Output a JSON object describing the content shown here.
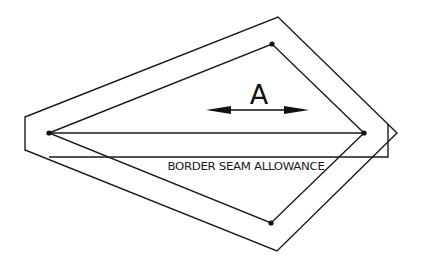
{
  "diagram": {
    "type": "sewing-pattern-piece",
    "stroke_color": "#1a1a1a",
    "background": "#ffffff",
    "outer_seam_outline": {
      "points": [
        [
          25,
          117
        ],
        [
          278,
          17
        ],
        [
          397,
          133
        ],
        [
          277,
          251
        ],
        [
          25,
          150
        ]
      ]
    },
    "inner_finish_line": {
      "points": [
        [
          49,
          133
        ],
        [
          272,
          44
        ],
        [
          364,
          133
        ],
        [
          271,
          223
        ]
      ]
    },
    "center_line": {
      "from": [
        49,
        133
      ],
      "to": [
        364,
        133
      ]
    },
    "border_seam_rectangle": {
      "points": [
        [
          49,
          157
        ],
        [
          388,
          157
        ],
        [
          388,
          124
        ]
      ]
    },
    "vertex_dots": [
      {
        "name": "left",
        "x": 49,
        "y": 133
      },
      {
        "name": "top",
        "x": 272,
        "y": 44
      },
      {
        "name": "right",
        "x": 364,
        "y": 133
      },
      {
        "name": "bottom",
        "x": 271,
        "y": 223
      }
    ],
    "dimension_arrow": {
      "label": "A",
      "from_x": 206,
      "to_x": 309,
      "y": 110
    },
    "labels": {
      "dimension": "A",
      "seam_allowance": "BORDER SEAM ALLOWANCE"
    }
  }
}
